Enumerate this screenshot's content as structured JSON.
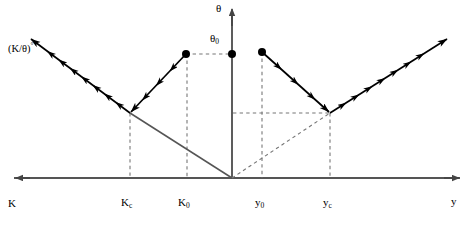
{
  "figure": {
    "colors": {
      "axis": "#555555",
      "ray": "#000000",
      "dashed": "#777777",
      "solid_diagonal": "#555555",
      "dot": "#000000",
      "background": "#ffffff"
    }
  },
  "axes": {
    "horizontal": {
      "left_label": "K",
      "right_label": "y",
      "y_position": 178,
      "left_arrow_x": 14,
      "right_arrow_x": 460
    },
    "vertical": {
      "label": "θ",
      "x_position": 232,
      "top_arrow_y": 8
    },
    "origin": {
      "x": 232,
      "y": 178
    }
  },
  "ticks": [
    {
      "name": "Kc",
      "label_main": "K",
      "label_sub": "c",
      "x": 130
    },
    {
      "name": "K0",
      "label_main": "K",
      "label_sub": "0",
      "x": 187
    },
    {
      "name": "y0",
      "label_main": "y",
      "label_sub": "0",
      "x": 262
    },
    {
      "name": "yc",
      "label_main": "y",
      "label_sub": "c",
      "x": 330
    }
  ],
  "annotations": {
    "ktheta_label": "(K/θ)",
    "ktheta_superscript": "°",
    "theta0_main": "θ",
    "theta0_sub": "0"
  },
  "points": [
    {
      "name": "theta0-axis-dot",
      "x": 232,
      "y": 54
    },
    {
      "name": "left-incoming-source-dot",
      "x": 186,
      "y": 54
    },
    {
      "name": "right-incoming-source-dot",
      "x": 262,
      "y": 52
    }
  ],
  "rays": {
    "left_vertex": {
      "x": 130,
      "y": 113
    },
    "right_vertex": {
      "x": 330,
      "y": 113
    },
    "left_incoming": {
      "from_x": 186,
      "from_y": 54,
      "to_x": 130,
      "to_y": 113
    },
    "left_outgoing": {
      "from_x": 130,
      "from_y": 113,
      "to_x": 30,
      "to_y": 38
    },
    "right_incoming": {
      "from_x": 262,
      "from_y": 52,
      "to_x": 330,
      "to_y": 113
    },
    "right_outgoing": {
      "from_x": 330,
      "from_y": 113,
      "to_x": 448,
      "to_y": 38
    }
  },
  "construction_lines": {
    "solid_diagonal": {
      "from_x": 130,
      "from_y": 113,
      "to_x": 232,
      "to_y": 178
    },
    "dashed_diagonal": {
      "from_x": 232,
      "from_y": 178,
      "to_x": 330,
      "to_y": 113
    },
    "dashed_horizontal_upper": {
      "from_x": 186,
      "from_y": 54,
      "to_x": 232,
      "to_y": 54
    },
    "dashed_horizontal_lower": {
      "from_x": 232,
      "from_y": 113,
      "to_x": 330,
      "to_y": 113
    },
    "vertical_dashed_x": [
      130,
      187,
      262,
      330
    ]
  }
}
